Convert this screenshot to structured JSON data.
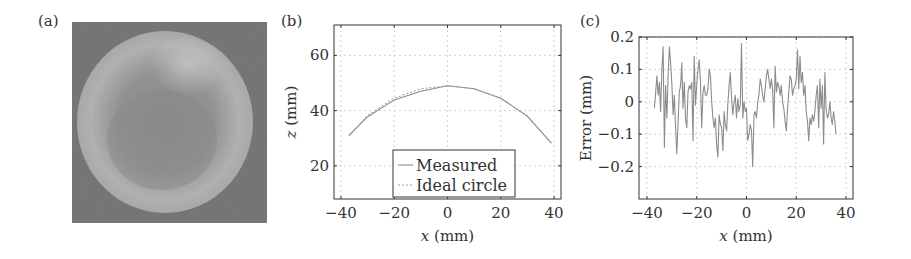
{
  "figure": {
    "panels": [
      {
        "label": "(a)",
        "type": "photograph",
        "description": "grayscale photo of a spherical object"
      },
      {
        "label": "(b)"
      },
      {
        "label": "(c)"
      }
    ]
  },
  "colors": {
    "curve": "#8c8c8c",
    "axis": "#333333",
    "grid": "#c8c8c8",
    "photo_bg": "#6f6f6f"
  },
  "chart_data": [
    {
      "type": "line",
      "panel": "(b)",
      "title": "",
      "xlabel": "x (mm)",
      "ylabel": "z (mm)",
      "xlim": [
        -42.6,
        42.6
      ],
      "ylim": [
        8,
        71
      ],
      "xticks": [
        -40,
        -20,
        0,
        20,
        40
      ],
      "xtick_labels": [
        "−40",
        "−20",
        "0",
        "20",
        "40"
      ],
      "yticks": [
        20,
        40,
        60
      ],
      "ytick_labels": [
        "20",
        "40",
        "60"
      ],
      "grid": true,
      "legend": {
        "position": "lower center",
        "entries": [
          "Measured",
          "Ideal circle"
        ]
      },
      "series": [
        {
          "name": "Measured",
          "style": "solid",
          "x": [
            -37,
            -30,
            -20,
            -10,
            0,
            10,
            20,
            30,
            39
          ],
          "y": [
            31.0,
            37.8,
            43.8,
            47.0,
            49.0,
            47.9,
            44.5,
            37.9,
            28.2
          ]
        },
        {
          "name": "Ideal circle",
          "style": "dotted",
          "x": [
            -37,
            -30,
            -20,
            -10,
            0,
            10,
            20,
            30,
            39
          ],
          "y": [
            31.0,
            38.2,
            44.5,
            47.9,
            49.0,
            47.9,
            44.5,
            38.2,
            28.2
          ]
        }
      ]
    },
    {
      "type": "line",
      "panel": "(c)",
      "title": "",
      "xlabel": "x (mm)",
      "ylabel": "Error (mm)",
      "xlim": [
        -43.2,
        42.8
      ],
      "ylim": [
        -0.3,
        0.2
      ],
      "xticks": [
        -40,
        -20,
        0,
        20,
        40
      ],
      "xtick_labels": [
        "−40",
        "−20",
        "0",
        "20",
        "40"
      ],
      "yticks": [
        -0.2,
        -0.1,
        0,
        0.1,
        0.2
      ],
      "ytick_labels": [
        "−0.2",
        "−0.1",
        "0",
        "0.1",
        "0.2"
      ],
      "grid": true,
      "series": [
        {
          "name": "Error",
          "x": [
            -37,
            -36.5,
            -36,
            -35.5,
            -35,
            -34.5,
            -34,
            -33.5,
            -33,
            -32.5,
            -32,
            -31.5,
            -31,
            -30.5,
            -30,
            -29.5,
            -29,
            -28.5,
            -28,
            -27.5,
            -27,
            -26.5,
            -26,
            -25.5,
            -25,
            -24.5,
            -24,
            -23.5,
            -23,
            -22.5,
            -22,
            -21.5,
            -21,
            -20.5,
            -20,
            -19.5,
            -19,
            -18.5,
            -18,
            -17.5,
            -17,
            -16.5,
            -16,
            -15.5,
            -15,
            -14.5,
            -14,
            -13.5,
            -13,
            -12.5,
            -12,
            -11.5,
            -11,
            -10.5,
            -10,
            -9.5,
            -9,
            -8.5,
            -8,
            -7.5,
            -7,
            -6.5,
            -6,
            -5.5,
            -5,
            -4.5,
            -4,
            -3.5,
            -3,
            -2.5,
            -2,
            -1.5,
            -1,
            -0.5,
            0,
            0.5,
            1,
            1.5,
            2,
            2.5,
            3,
            3.5,
            4,
            4.5,
            5,
            5.5,
            6,
            6.5,
            7,
            7.5,
            8,
            8.5,
            9,
            9.5,
            10,
            10.5,
            11,
            11.5,
            12,
            12.5,
            13,
            13.5,
            14,
            14.5,
            15,
            15.5,
            16,
            16.5,
            17,
            17.5,
            18,
            18.5,
            19,
            19.5,
            20,
            20.5,
            21,
            21.5,
            22,
            22.5,
            23,
            23.5,
            24,
            24.5,
            25,
            25.5,
            26,
            26.5,
            27,
            27.5,
            28,
            28.5,
            29,
            29.5,
            30,
            30.5,
            31,
            31.5,
            32,
            32.5,
            33,
            33.5,
            34,
            34.5,
            35,
            35.5,
            36
          ],
          "y": [
            -0.02,
            0.03,
            0.08,
            0.02,
            0.06,
            -0.03,
            0.1,
            0.17,
            -0.14,
            0.05,
            -0.05,
            0.08,
            0.17,
            0.12,
            0.06,
            -0.04,
            0.02,
            -0.08,
            -0.16,
            -0.06,
            0.03,
            0.05,
            0.12,
            -0.02,
            0.06,
            -0.05,
            -0.08,
            0.03,
            0.05,
            0.04,
            0.06,
            -0.12,
            0.14,
            -0.01,
            0.05,
            0.1,
            0.13,
            0.06,
            -0.08,
            0.03,
            0.05,
            0.02,
            0.02,
            0.04,
            0.1,
            0.08,
            0.0,
            -0.05,
            -0.08,
            -0.05,
            -0.13,
            -0.17,
            -0.04,
            -0.07,
            -0.08,
            -0.15,
            -0.03,
            -0.07,
            -0.09,
            -0.01,
            0.05,
            0.09,
            0.01,
            -0.04,
            0.0,
            0.02,
            -0.05,
            0.01,
            -0.03,
            -0.01,
            0.18,
            -0.05,
            0.0,
            -0.03,
            -0.02,
            -0.12,
            -0.1,
            -0.07,
            -0.09,
            -0.2,
            -0.04,
            -0.03,
            -0.05,
            0.0,
            0.02,
            0.07,
            0.05,
            0.02,
            0.0,
            0.04,
            0.08,
            0.1,
            0.07,
            0.04,
            0.07,
            0.04,
            -0.08,
            0.11,
            0.03,
            0.06,
            0.05,
            0.02,
            0.05,
            0.0,
            -0.02,
            -0.06,
            -0.09,
            -0.02,
            0.03,
            0.08,
            0.07,
            0.02,
            0.04,
            0.05,
            0.07,
            0.16,
            0.04,
            0.14,
            0.06,
            0.09,
            0.02,
            0.05,
            -0.03,
            -0.06,
            -0.12,
            -0.05,
            -0.07,
            -0.04,
            -0.06,
            -0.03,
            0.02,
            0.05,
            -0.08,
            0.07,
            -0.02,
            0.05,
            -0.13,
            0.09,
            -0.02,
            -0.05,
            -0.04,
            0.0,
            -0.05,
            -0.07,
            -0.03,
            -0.06,
            -0.1
          ]
        }
      ]
    }
  ]
}
